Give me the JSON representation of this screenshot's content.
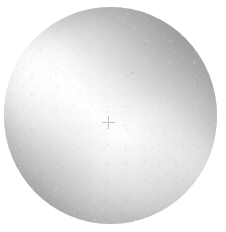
{
  "image": {
    "kind": "grayscale-photograph",
    "subject_label": "circular specimen disc",
    "background_color": "#ffffff",
    "canvas": {
      "width": 226,
      "height": 232
    }
  },
  "specimen": {
    "shape": "circle",
    "bounds": {
      "left": 4,
      "top": 7,
      "width": 213,
      "height": 217
    },
    "center": {
      "x": 110,
      "y": 115
    },
    "diameter_px": 214,
    "edge": "soft / slightly out-of-focus",
    "tone_range": {
      "lightest": "#fbfbfb",
      "midtone": "#d8d8d8",
      "darkest": "#b4b4b4"
    }
  },
  "illumination": {
    "type": "diagonal specular band",
    "direction": "lower-left to upper-right",
    "band_angle_deg": 34,
    "highlight_color": "#fdfdfd",
    "shadow_regions": [
      "upper-right rim",
      "lower-left rim",
      "lower-right rim"
    ],
    "shadow_color": "#b8b8b8"
  },
  "markers": {
    "center_cross": {
      "label": "fiducial cross",
      "x": 108,
      "y": 122,
      "size_px": 13,
      "color": "#8f8f8f"
    },
    "specks": [
      {
        "label": "surface speck",
        "x": 131,
        "y": 72
      },
      {
        "label": "surface speck",
        "x": 127,
        "y": 75
      },
      {
        "label": "surface speck",
        "x": 52,
        "y": 96
      },
      {
        "label": "surface speck",
        "x": 165,
        "y": 148
      },
      {
        "label": "surface speck",
        "x": 88,
        "y": 176
      },
      {
        "label": "surface speck",
        "x": 146,
        "y": 112
      }
    ]
  }
}
